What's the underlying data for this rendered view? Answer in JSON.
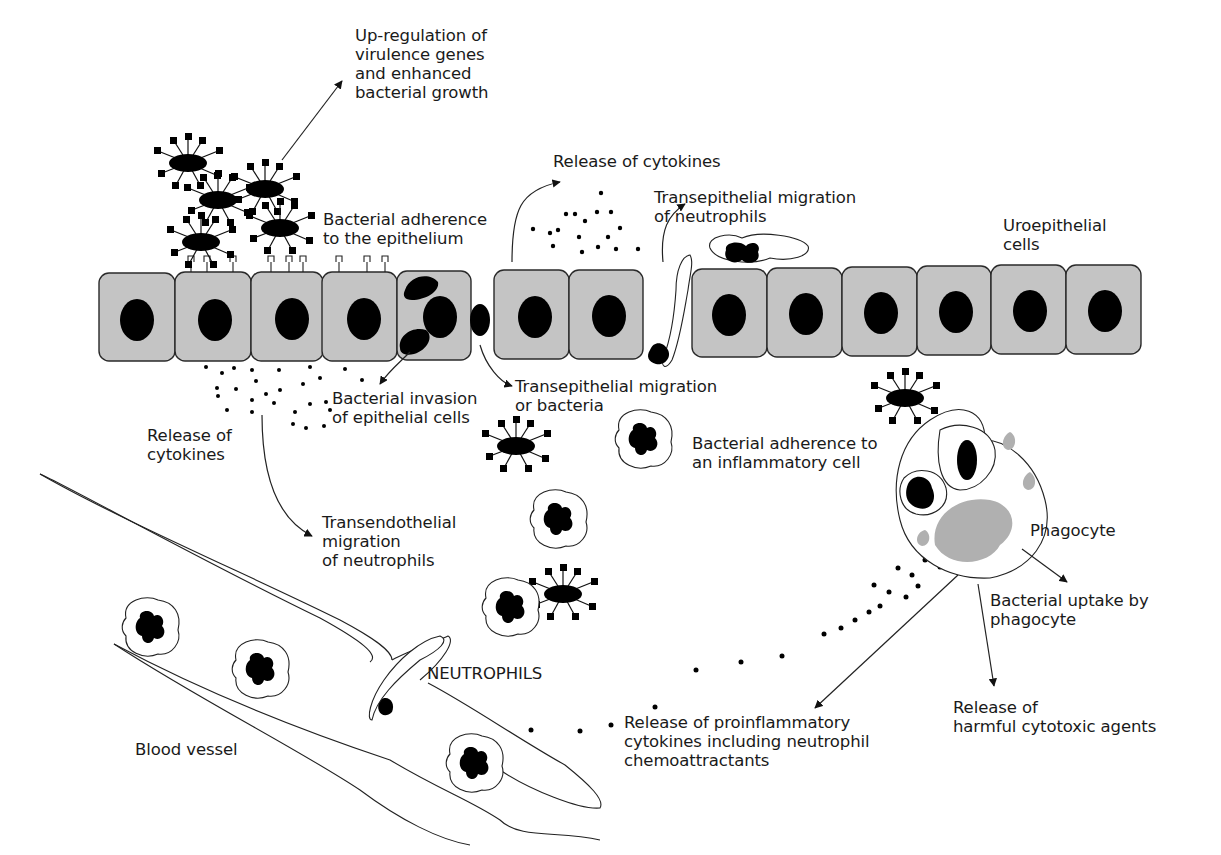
{
  "diagram": {
    "type": "biological pathway illustration",
    "colors": {
      "epithelial_cell_fill": "#c4c4c4",
      "nucleus": "#000000",
      "granule": "#b0b0b0",
      "outline": "#222222",
      "background": "#ffffff"
    }
  },
  "labels": {
    "upregulation": "Up-regulation of\nvirulence genes\nand enhanced\nbacterial growth",
    "adherence_epithelium": "Bacterial adherence\nto the epithelium",
    "release_cytokines_top": "Release of cytokines",
    "transepithelial_neutrophils": "Transepithelial migration\nof neutrophils",
    "uroepithelial_cells": "Uroepithelial\ncells",
    "bacterial_invasion": "Bacterial invasion\nof epithelial cells",
    "transepithelial_bacteria": "Transepithelial migration\nor bacteria",
    "release_cytokines_left": "Release of\ncytokines",
    "adherence_inflammatory": "Bacterial adherence to\nan inflammatory cell",
    "transendothelial": "Transendothelial\nmigration\nof neutrophils",
    "phagocyte": "Phagocyte",
    "uptake": "Bacterial uptake by\nphagocyte",
    "neutrophils": "NEUTROPHILS",
    "proinflammatory": "Release of proinflammatory\ncytokines including neutrophil\nchemoattractants",
    "cytotoxic": "Release of\nharmful cytotoxic agents",
    "blood_vessel": "Blood vessel"
  }
}
